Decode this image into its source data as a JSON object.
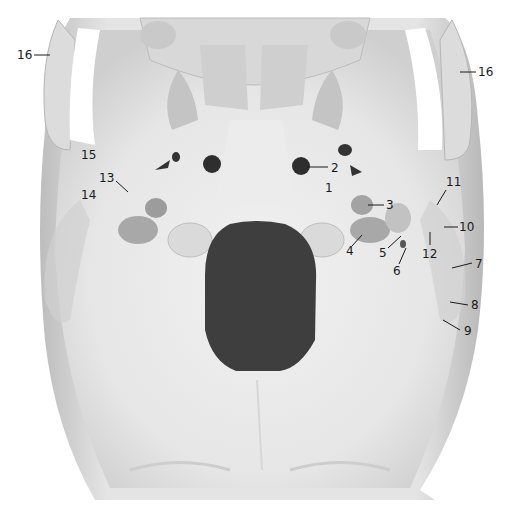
{
  "figure": {
    "background_color": "#ffffff",
    "bone_color": "#e9e9e9",
    "shadow_color": "#9a9a9a",
    "foramen_color": "#3f3f3f",
    "label_color": "#1a1a1a"
  },
  "labels": [
    {
      "id": "1",
      "text": "1",
      "x": 325,
      "y": 182
    },
    {
      "id": "2",
      "text": "2",
      "x": 331,
      "y": 162,
      "line": [
        307,
        167,
        328,
        167
      ]
    },
    {
      "id": "3",
      "text": "3",
      "x": 386,
      "y": 199,
      "line": [
        368,
        205,
        384,
        205
      ]
    },
    {
      "id": "4",
      "text": "4",
      "x": 346,
      "y": 245,
      "line": [
        362,
        235,
        352,
        246
      ]
    },
    {
      "id": "5",
      "text": "5",
      "x": 379,
      "y": 247,
      "line": [
        401,
        236,
        388,
        248
      ]
    },
    {
      "id": "6",
      "text": "6",
      "x": 393,
      "y": 265,
      "line": [
        406,
        248,
        399,
        264
      ]
    },
    {
      "id": "7",
      "text": "7",
      "x": 475,
      "y": 258,
      "line": [
        452,
        268,
        472,
        263
      ]
    },
    {
      "id": "8",
      "text": "8",
      "x": 471,
      "y": 299,
      "line": [
        450,
        302,
        468,
        305
      ]
    },
    {
      "id": "9",
      "text": "9",
      "x": 464,
      "y": 325,
      "line": [
        443,
        320,
        460,
        330
      ]
    },
    {
      "id": "10",
      "text": "10",
      "x": 459,
      "y": 221,
      "line": [
        444,
        227,
        458,
        227
      ]
    },
    {
      "id": "11",
      "text": "11",
      "x": 446,
      "y": 176,
      "line": [
        446,
        190,
        437,
        205
      ]
    },
    {
      "id": "12",
      "text": "12",
      "x": 422,
      "y": 248,
      "line": [
        430,
        232,
        430,
        245
      ]
    },
    {
      "id": "13",
      "text": "13",
      "x": 99,
      "y": 172,
      "line": [
        116,
        181,
        128,
        192
      ]
    },
    {
      "id": "14",
      "text": "14",
      "x": 81,
      "y": 189
    },
    {
      "id": "15",
      "text": "15",
      "x": 81,
      "y": 149
    },
    {
      "id": "16L",
      "text": "16",
      "x": 17,
      "y": 49,
      "line": [
        34,
        55,
        50,
        55
      ]
    },
    {
      "id": "16R",
      "text": "16",
      "x": 478,
      "y": 66,
      "line": [
        460,
        72,
        476,
        72
      ]
    }
  ]
}
